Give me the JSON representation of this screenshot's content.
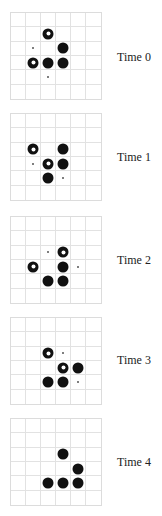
{
  "figure": {
    "grid_size": {
      "cols": 6,
      "rows": 6
    },
    "legend": {
      "filled": "filled-disc",
      "ring": "hollow-ring",
      "dot": "small-dot"
    },
    "frames": [
      {
        "label": "Time 0",
        "top": 12,
        "label_top": 50,
        "cells": [
          {
            "row": 1,
            "col": 2,
            "type": "ring"
          },
          {
            "row": 2,
            "col": 1,
            "type": "dot"
          },
          {
            "row": 2,
            "col": 3,
            "type": "filled"
          },
          {
            "row": 3,
            "col": 1,
            "type": "ring"
          },
          {
            "row": 3,
            "col": 2,
            "type": "filled"
          },
          {
            "row": 3,
            "col": 3,
            "type": "filled"
          },
          {
            "row": 4,
            "col": 2,
            "type": "dot"
          }
        ]
      },
      {
        "label": "Time 1",
        "top": 113,
        "label_top": 150,
        "cells": [
          {
            "row": 2,
            "col": 1,
            "type": "ring"
          },
          {
            "row": 2,
            "col": 3,
            "type": "filled"
          },
          {
            "row": 3,
            "col": 1,
            "type": "dot"
          },
          {
            "row": 3,
            "col": 2,
            "type": "ring"
          },
          {
            "row": 3,
            "col": 3,
            "type": "filled"
          },
          {
            "row": 4,
            "col": 2,
            "type": "filled"
          },
          {
            "row": 4,
            "col": 3,
            "type": "dot"
          }
        ]
      },
      {
        "label": "Time 2",
        "top": 216,
        "label_top": 253,
        "cells": [
          {
            "row": 2,
            "col": 2,
            "type": "dot"
          },
          {
            "row": 2,
            "col": 3,
            "type": "ring"
          },
          {
            "row": 3,
            "col": 1,
            "type": "ring"
          },
          {
            "row": 3,
            "col": 3,
            "type": "filled"
          },
          {
            "row": 3,
            "col": 4,
            "type": "dot"
          },
          {
            "row": 4,
            "col": 2,
            "type": "filled"
          },
          {
            "row": 4,
            "col": 3,
            "type": "filled"
          }
        ]
      },
      {
        "label": "Time 3",
        "top": 317,
        "label_top": 353,
        "cells": [
          {
            "row": 2,
            "col": 2,
            "type": "ring"
          },
          {
            "row": 2,
            "col": 3,
            "type": "dot"
          },
          {
            "row": 3,
            "col": 3,
            "type": "ring"
          },
          {
            "row": 3,
            "col": 4,
            "type": "filled"
          },
          {
            "row": 4,
            "col": 2,
            "type": "filled"
          },
          {
            "row": 4,
            "col": 3,
            "type": "filled"
          },
          {
            "row": 4,
            "col": 4,
            "type": "dot"
          }
        ]
      },
      {
        "label": "Time 4",
        "top": 418,
        "label_top": 455,
        "cells": [
          {
            "row": 2,
            "col": 3,
            "type": "filled"
          },
          {
            "row": 3,
            "col": 4,
            "type": "filled"
          },
          {
            "row": 4,
            "col": 2,
            "type": "filled"
          },
          {
            "row": 4,
            "col": 3,
            "type": "filled"
          },
          {
            "row": 4,
            "col": 4,
            "type": "filled"
          }
        ]
      }
    ]
  }
}
